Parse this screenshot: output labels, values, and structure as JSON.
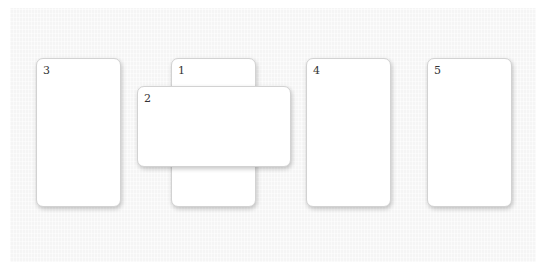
{
  "board": {
    "background_color": "#f5f5f5",
    "cards": [
      {
        "id": "card-3",
        "label": "3",
        "orientation": "portrait"
      },
      {
        "id": "card-1",
        "label": "1",
        "orientation": "portrait"
      },
      {
        "id": "card-2",
        "label": "2",
        "orientation": "landscape"
      },
      {
        "id": "card-4",
        "label": "4",
        "orientation": "portrait"
      },
      {
        "id": "card-5",
        "label": "5",
        "orientation": "portrait"
      }
    ]
  }
}
